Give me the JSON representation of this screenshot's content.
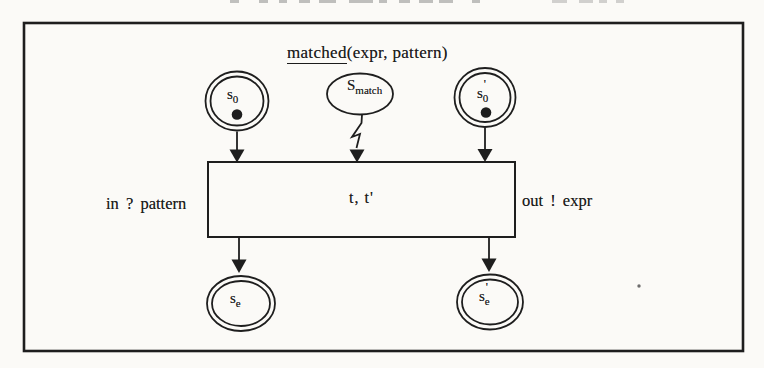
{
  "figure": {
    "title": {
      "underlined": "matched",
      "rest": "(expr, pattern)"
    },
    "transition": {
      "label": "t, t'",
      "input_label": "in ? pattern",
      "output_label": "out ! expr"
    },
    "places": {
      "s0": {
        "base": "s",
        "sub": "0",
        "prime": "",
        "has_token": true
      },
      "s_match": {
        "base": "S",
        "sub": "match",
        "prime": "",
        "has_token": false
      },
      "s0_prime": {
        "base": "s",
        "sub": "0",
        "prime": "'",
        "has_token": true
      },
      "s_e": {
        "base": "s",
        "sub": "e",
        "prime": "",
        "has_token": false
      },
      "s_e_prime": {
        "base": "s",
        "sub": "e",
        "prime": "'",
        "has_token": false
      }
    }
  },
  "colors": {
    "ink": "#1e1e1e",
    "paper": "#fbfaf7"
  }
}
